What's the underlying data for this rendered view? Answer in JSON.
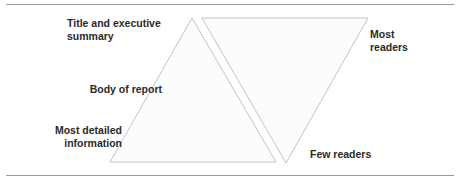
{
  "diagram": {
    "left_pyramid": {
      "shape": "triangle-upright",
      "labels": [
        {
          "text": "Title and executive summary",
          "position": "top"
        },
        {
          "text": "Body of report",
          "position": "middle"
        },
        {
          "text": "Most detailed information",
          "position": "bottom"
        }
      ]
    },
    "right_pyramid": {
      "shape": "triangle-inverted",
      "labels": [
        {
          "text": "Most readers",
          "position": "top"
        },
        {
          "text": "Few readers",
          "position": "bottom"
        }
      ]
    },
    "colors": {
      "outline": "#c0c0c0",
      "rule": "#9a9a9a",
      "text": "#2a2a2a"
    }
  }
}
